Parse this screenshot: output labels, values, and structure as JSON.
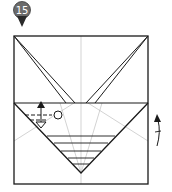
{
  "step": {
    "number": "15",
    "badge_color": "#6b6b6b"
  },
  "diagram": {
    "type": "origami-step",
    "paper_color": "#ffffff",
    "line_color": "#1a1a1a",
    "crease_color": "#b0b0b0",
    "symbols": [
      "mountain-fold-arrow",
      "pleat-fold-symbol",
      "reference-circle",
      "turn-over-arrow"
    ]
  }
}
